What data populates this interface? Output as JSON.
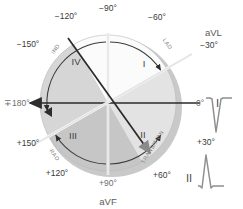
{
  "diagram": {
    "center": {
      "x": 108,
      "y": 103
    },
    "radius": 68,
    "shadow_color": "#c9c9c9",
    "axis_color": "#2a2a2a",
    "arc_color": "#4a4a4a"
  },
  "degrees": [
    {
      "label": "−90°",
      "angle": -90,
      "x": 108,
      "y": 11,
      "anchor": "middle",
      "style": "dark"
    },
    {
      "label": "−60°",
      "angle": -60,
      "x": 157,
      "y": 20,
      "anchor": "middle",
      "style": "dark"
    },
    {
      "label": "−30°",
      "angle": -30,
      "x": 200,
      "y": 48,
      "anchor": "start",
      "style": "dark"
    },
    {
      "label": "0°",
      "angle": 0,
      "x": 196,
      "y": 106,
      "anchor": "start",
      "style": "light"
    },
    {
      "label": "+30°",
      "angle": 30,
      "x": 197,
      "y": 145,
      "anchor": "start",
      "style": "dark"
    },
    {
      "label": "+60°",
      "angle": 60,
      "x": 162,
      "y": 178,
      "anchor": "middle",
      "style": "dark"
    },
    {
      "label": "+90°",
      "angle": 90,
      "x": 108,
      "y": 186,
      "anchor": "middle",
      "style": "light"
    },
    {
      "label": "+120°",
      "angle": 120,
      "x": 57,
      "y": 176,
      "anchor": "middle",
      "style": "dark"
    },
    {
      "label": "+150°",
      "angle": 150,
      "x": 28,
      "y": 146,
      "anchor": "middle",
      "style": "dark"
    },
    {
      "label": "∓180°",
      "angle": 180,
      "x": 4,
      "y": 106,
      "anchor": "start",
      "style": "light"
    },
    {
      "label": "−150°",
      "angle": -150,
      "x": 28,
      "y": 47,
      "anchor": "middle",
      "style": "dark"
    },
    {
      "label": "−120°",
      "angle": -120,
      "x": 66,
      "y": 19,
      "anchor": "middle",
      "style": "dark"
    }
  ],
  "leads": [
    {
      "name": "aVL",
      "x": 205,
      "y": 36,
      "anchor": "start",
      "size": "small"
    },
    {
      "name": "aVF",
      "x": 108,
      "y": 205,
      "anchor": "middle",
      "size": "small"
    },
    {
      "name": "I",
      "x": 216,
      "y": 106,
      "anchor": "start",
      "size": "big"
    },
    {
      "name": "II",
      "x": 189,
      "y": 182,
      "anchor": "middle",
      "size": "big"
    }
  ],
  "quadrants": [
    {
      "numeral": "I",
      "x": 144,
      "y": 67,
      "fill": "#fbfbfb"
    },
    {
      "numeral": "II",
      "x": 143,
      "y": 138,
      "fill": "#e3e3e3"
    },
    {
      "numeral": "III",
      "x": 73,
      "y": 139,
      "fill": "#c6c6c6"
    },
    {
      "numeral": "IV",
      "x": 76,
      "y": 65,
      "fill": "#d6d6d6"
    }
  ],
  "arc_labels": [
    {
      "text": "LAD",
      "x": 166,
      "y": 45,
      "rotate": 55
    },
    {
      "text": "RAD",
      "x": 53,
      "y": 156,
      "rotate": 55
    },
    {
      "text": "IND",
      "x": 57,
      "y": 50,
      "rotate": -55
    },
    {
      "text": "TRANSITION",
      "x": 154,
      "y": 148,
      "rotate": -58
    }
  ],
  "waveforms": [
    {
      "name": "lead-I-complex",
      "label": "I",
      "polarity": "negative",
      "x": 214,
      "y": 110
    },
    {
      "name": "lead-II-complex",
      "label": "II",
      "polarity": "positive",
      "x": 208,
      "y": 178
    }
  ]
}
